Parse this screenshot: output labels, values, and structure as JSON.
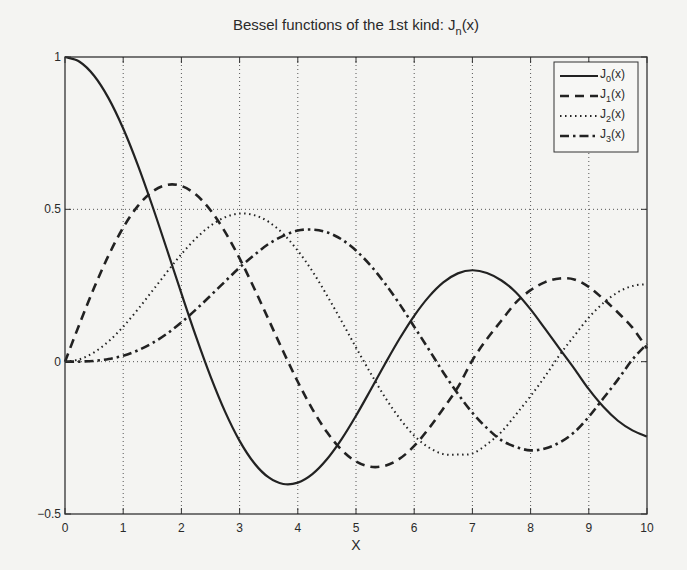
{
  "chart_data": {
    "type": "line",
    "title": "Bessel functions of the 1st kind: J",
    "title_subscript": "n",
    "title_suffix": "(x)",
    "xlabel": "X",
    "ylabel": "",
    "xlim": [
      0,
      10
    ],
    "ylim": [
      -0.5,
      1
    ],
    "xticks": [
      0,
      1,
      2,
      3,
      4,
      5,
      6,
      7,
      8,
      9,
      10
    ],
    "xtick_labels": [
      "0",
      "1",
      "2",
      "3",
      "4",
      "5",
      "6",
      "7",
      "8",
      "9",
      "10"
    ],
    "yticks": [
      -0.5,
      0,
      0.5,
      1
    ],
    "ytick_labels": [
      "-0.5",
      "0",
      "0.5",
      "1"
    ],
    "grid": true,
    "legend_position": "top-right",
    "x": [
      0,
      0.25,
      0.5,
      0.75,
      1,
      1.25,
      1.5,
      1.75,
      2,
      2.25,
      2.5,
      2.75,
      3,
      3.25,
      3.5,
      3.75,
      4,
      4.25,
      4.5,
      4.75,
      5,
      5.25,
      5.5,
      5.75,
      6,
      6.25,
      6.5,
      6.75,
      7,
      7.25,
      7.5,
      7.75,
      8,
      8.25,
      8.5,
      8.75,
      9,
      9.25,
      9.5,
      9.75,
      10
    ],
    "series": [
      {
        "name": "J0(x)",
        "label_main": "J",
        "label_sub": "0",
        "label_suffix": "(x)",
        "style": "solid",
        "values": [
          1.0,
          0.9844,
          0.9385,
          0.8642,
          0.7652,
          0.6459,
          0.5118,
          0.369,
          0.2239,
          0.0827,
          -0.0484,
          -0.1641,
          -0.2601,
          -0.3328,
          -0.3801,
          -0.4014,
          -0.3971,
          -0.3692,
          -0.3205,
          -0.2551,
          -0.1776,
          -0.0931,
          -0.0068,
          0.0759,
          0.1506,
          0.2127,
          0.2601,
          0.2898,
          0.3001,
          0.2911,
          0.2663,
          0.2273,
          0.1717,
          0.1076,
          0.0419,
          -0.0228,
          -0.0903,
          -0.1481,
          -0.1939,
          -0.2255,
          -0.2459
        ]
      },
      {
        "name": "J1(x)",
        "label_main": "J",
        "label_sub": "1",
        "label_suffix": "(x)",
        "style": "dashed",
        "values": [
          0.0,
          0.124,
          0.2423,
          0.3492,
          0.4401,
          0.5106,
          0.5579,
          0.5802,
          0.5767,
          0.5484,
          0.4971,
          0.426,
          0.3391,
          0.2411,
          0.1374,
          0.0332,
          -0.066,
          -0.1555,
          -0.2311,
          -0.2892,
          -0.3276,
          -0.3449,
          -0.3414,
          -0.3185,
          -0.2767,
          -0.2196,
          -0.1538,
          -0.084,
          0.0047,
          0.0744,
          0.1352,
          0.1946,
          0.2346,
          0.2611,
          0.2731,
          0.2701,
          0.2453,
          0.2057,
          0.1613,
          0.1117,
          0.0435
        ]
      },
      {
        "name": "J2(x)",
        "label_main": "J",
        "label_sub": "2",
        "label_suffix": "(x)",
        "style": "dotted",
        "values": [
          0.0,
          0.0078,
          0.0306,
          0.0667,
          0.1149,
          0.1711,
          0.2321,
          0.2936,
          0.3528,
          0.4047,
          0.4461,
          0.4739,
          0.4861,
          0.4811,
          0.4586,
          0.4195,
          0.3641,
          0.2971,
          0.2178,
          0.1334,
          0.0466,
          -0.0374,
          -0.1173,
          -0.1861,
          -0.2429,
          -0.2817,
          -0.3034,
          -0.3049,
          -0.3014,
          -0.271,
          -0.2303,
          -0.1731,
          -0.113,
          -0.0478,
          0.0223,
          0.0846,
          0.1448,
          0.1925,
          0.2279,
          0.2485,
          0.2546
        ]
      },
      {
        "name": "J3(x)",
        "label_main": "J",
        "label_sub": "3",
        "label_suffix": "(x)",
        "style": "dash-dot",
        "values": [
          0.0,
          0.0003,
          0.0026,
          0.0085,
          0.0196,
          0.0371,
          0.061,
          0.0915,
          0.1289,
          0.1712,
          0.2166,
          0.2631,
          0.3091,
          0.3497,
          0.3868,
          0.4131,
          0.4302,
          0.4337,
          0.4247,
          0.4017,
          0.3648,
          0.3158,
          0.2561,
          0.1888,
          0.1148,
          0.0406,
          -0.0353,
          -0.1051,
          -0.1676,
          -0.218,
          -0.2581,
          -0.28,
          -0.2911,
          -0.2848,
          -0.2651,
          -0.2318,
          -0.1809,
          -0.1203,
          -0.059,
          0.007,
          0.0584
        ]
      }
    ]
  }
}
